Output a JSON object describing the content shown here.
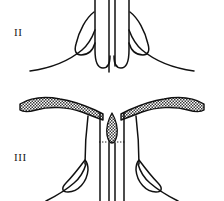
{
  "plate": {
    "background_color": "#ffffff",
    "ink_color": "#111111",
    "width": 224,
    "height": 201,
    "figures": [
      {
        "id": "figure-ii",
        "label": "II",
        "label_position": {
          "x": 14,
          "y": 27
        },
        "description": "bilaterally symmetric line-drawn structure, upper panel",
        "shading": "none"
      },
      {
        "id": "figure-iii",
        "label": "III",
        "label_position": {
          "x": 14,
          "y": 152
        },
        "description": "bilaterally symmetric line-drawn structure with stippled lateral flanges and a central stippled lanceolate body, lower panel",
        "shading": "stippled"
      }
    ]
  },
  "labels": {
    "figure_two": "II",
    "figure_three": "III"
  },
  "colors": {
    "ink": "#111111",
    "paper": "#ffffff",
    "stipple_fill": "#b9b9b9",
    "stipple_dot": "#2a2a2a"
  },
  "geometry": {
    "figure_ii": {
      "center_x": 112,
      "midline_top": 0,
      "midline_bottom": 72,
      "inner_tube_left_x": 95,
      "inner_tube_right_x": 129,
      "outer_sweep_left_end_x": 30,
      "outer_sweep_right_end_x": 194,
      "sweep_baseline_y": 72
    },
    "figure_iii": {
      "center_x": 112,
      "flange_left_tip_x": 20,
      "flange_right_tip_x": 204,
      "flange_y": 102,
      "dotted_rule_y": 142,
      "lanceolate_center_x": 112,
      "lanceolate_top_y": 114,
      "lanceolate_bottom_y": 142,
      "column_left_x": 100,
      "column_right_x": 124,
      "bottom_cut_y": 201
    }
  }
}
